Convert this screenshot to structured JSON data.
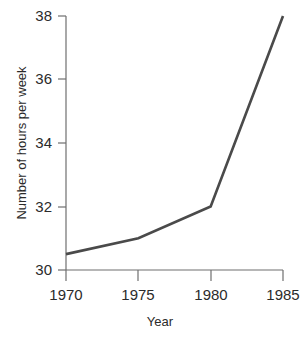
{
  "chart_data": {
    "type": "line",
    "title": "",
    "xlabel": "Year",
    "ylabel": "Number of hours per week",
    "x": [
      1970,
      1975,
      1980,
      1985
    ],
    "categories": [
      "1970",
      "1975",
      "1980",
      "1985"
    ],
    "values": [
      30.5,
      31.0,
      32.0,
      38.0
    ],
    "series": [
      {
        "name": "Number of hours per week",
        "values": [
          30.5,
          31.0,
          32.0,
          38.0
        ]
      }
    ],
    "xlim": [
      1970,
      1985
    ],
    "ylim": [
      30,
      38
    ],
    "xticks": [
      "1970",
      "1975",
      "1980",
      "1985"
    ],
    "yticks": [
      "30",
      "32",
      "34",
      "36",
      "38"
    ],
    "ytick_values": [
      30,
      32,
      34,
      36,
      38
    ],
    "grid": false,
    "legend": false,
    "legend_position": "none",
    "line_color": "#4a4a4a",
    "axis_color": "#6f6f6f",
    "background_color": "#ffffff"
  }
}
